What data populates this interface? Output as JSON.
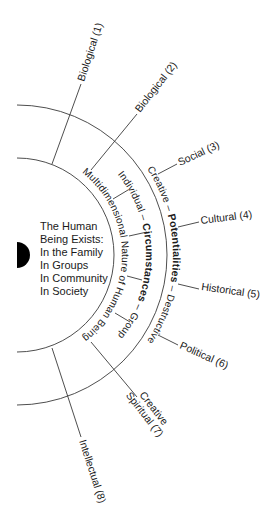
{
  "diagram": {
    "center": {
      "lines": [
        "The Human",
        "Being Exists:",
        "In the Family",
        "In Groups",
        "In Community",
        "In Society"
      ]
    },
    "rings": {
      "inner": {
        "text": "Multidimensional Nature of Human Being"
      },
      "middle": {
        "left": "Individual – ",
        "center": "Circumstances",
        "right": " – Group"
      },
      "outer": {
        "left": "Creative – ",
        "center": "Potentialities",
        "right": " – Destructive"
      }
    },
    "dimensions": [
      {
        "id": 1,
        "label": "Biological (1)"
      },
      {
        "id": 2,
        "label": "Biological (2)"
      },
      {
        "id": 3,
        "label": "Social (3)"
      },
      {
        "id": 4,
        "label": "Cultural (4)"
      },
      {
        "id": 5,
        "label": "Historical (5)"
      },
      {
        "id": 6,
        "label": "Political (6)"
      },
      {
        "id": 7,
        "label_line1": "Creative",
        "label_line2": "Spiritual (7)"
      },
      {
        "id": 8,
        "label": "Intellectual (8)"
      }
    ],
    "colors": {
      "line": "#3a3a3a",
      "text": "#1a1a1a",
      "marker": "#000000",
      "background": "#ffffff"
    }
  }
}
